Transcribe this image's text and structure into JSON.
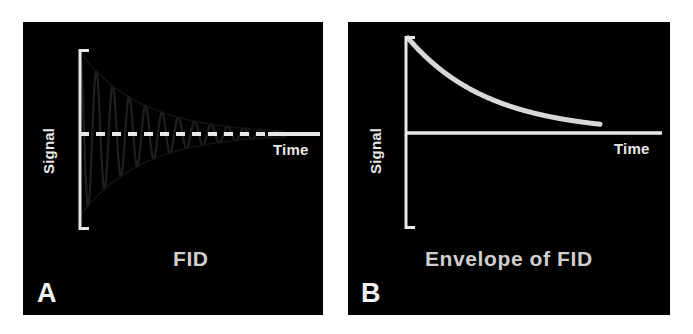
{
  "figure": {
    "background_color": "#ffffff",
    "panel_background_color": "#000000",
    "line_color": "#e8e8e8",
    "fid_trace_color": "#1c1c1c",
    "caption_color": "#cfcfcf",
    "width": 693,
    "height": 334
  },
  "panel_a": {
    "letter": "A",
    "caption": "FID",
    "y_axis_label": "Signal",
    "x_axis_label": "Time",
    "icons": {
      "y_bracket": "y-axis-bracket-icon",
      "x_axis": "x-axis-line-icon"
    }
  },
  "panel_b": {
    "letter": "B",
    "caption": "Envelope of FID",
    "y_axis_label": "Signal",
    "x_axis_label": "Time",
    "icons": {
      "y_bracket": "y-axis-bracket-icon",
      "x_axis": "x-axis-line-icon"
    }
  },
  "chart_data": [
    {
      "type": "line",
      "id": "fid",
      "title": "FID",
      "xlabel": "Time",
      "ylabel": "Signal",
      "grid": false,
      "legend": "none",
      "xlim": [
        0,
        1
      ],
      "ylim": [
        -1,
        1
      ],
      "description": "Damped cosine free induction decay oscillating about a dashed zero baseline",
      "model": {
        "function": "A*exp(-t/T2star)*cos(2*pi*f*t)",
        "amplitude": 1.0,
        "decay_constant_T2star": 0.3,
        "frequency_cycles": 12.5
      },
      "baseline": {
        "style": "dashed",
        "value": 0,
        "dash_end_fraction": 0.79,
        "solid_tail_fraction": 0.21
      },
      "series": [
        {
          "name": "FID signal",
          "color": "#1c1c1c",
          "x": [
            0.0,
            0.02,
            0.04,
            0.06,
            0.08,
            0.1,
            0.12,
            0.14,
            0.16,
            0.18,
            0.2,
            0.22,
            0.24,
            0.26,
            0.28,
            0.3,
            0.32,
            0.34,
            0.36,
            0.38,
            0.4,
            0.44,
            0.48,
            0.52,
            0.56,
            0.6,
            0.64,
            0.68,
            0.72,
            0.76,
            0.8,
            0.84,
            0.88,
            0.92,
            0.96,
            1.0
          ],
          "y": [
            1.0,
            0.64,
            -0.27,
            -0.84,
            -0.72,
            -0.04,
            0.63,
            0.75,
            0.33,
            -0.29,
            -0.63,
            -0.51,
            -0.06,
            0.38,
            0.51,
            0.31,
            -0.07,
            -0.35,
            -0.39,
            -0.21,
            0.06,
            0.28,
            -0.01,
            -0.21,
            0.07,
            0.15,
            -0.09,
            -0.1,
            0.07,
            0.07,
            -0.05,
            -0.05,
            0.04,
            0.03,
            -0.02,
            0.01
          ]
        },
        {
          "name": "Positive envelope",
          "color": "#1c1c1c",
          "x": [
            0.0,
            0.1,
            0.2,
            0.3,
            0.4,
            0.5,
            0.6,
            0.7,
            0.8,
            0.9,
            1.0
          ],
          "y": [
            1.0,
            0.72,
            0.51,
            0.37,
            0.26,
            0.19,
            0.14,
            0.1,
            0.07,
            0.05,
            0.04
          ]
        },
        {
          "name": "Negative envelope",
          "color": "#1c1c1c",
          "x": [
            0.0,
            0.1,
            0.2,
            0.3,
            0.4,
            0.5,
            0.6,
            0.7,
            0.8,
            0.9,
            1.0
          ],
          "y": [
            -1.0,
            -0.72,
            -0.51,
            -0.37,
            -0.26,
            -0.19,
            -0.14,
            -0.1,
            -0.07,
            -0.05,
            -0.04
          ]
        }
      ]
    },
    {
      "type": "line",
      "id": "envelope",
      "title": "Envelope of FID",
      "xlabel": "Time",
      "ylabel": "Signal",
      "grid": false,
      "legend": "none",
      "xlim": [
        0,
        1
      ],
      "ylim": [
        0,
        1
      ],
      "description": "Monoexponential decay curve representing the envelope of the FID",
      "model": {
        "function": "A*exp(-t/T2star)",
        "amplitude": 1.0,
        "decay_constant_T2star": 0.42
      },
      "series": [
        {
          "name": "Envelope",
          "color": "#e0e0e0",
          "x": [
            0.0,
            0.05,
            0.1,
            0.15,
            0.2,
            0.25,
            0.3,
            0.35,
            0.4,
            0.45,
            0.5,
            0.55,
            0.6,
            0.65,
            0.7,
            0.75,
            0.8,
            0.85,
            0.9,
            0.95,
            1.0
          ],
          "y": [
            1.0,
            0.89,
            0.79,
            0.7,
            0.62,
            0.55,
            0.49,
            0.44,
            0.39,
            0.34,
            0.3,
            0.27,
            0.24,
            0.21,
            0.19,
            0.17,
            0.15,
            0.13,
            0.12,
            0.11,
            0.1
          ]
        }
      ]
    }
  ]
}
